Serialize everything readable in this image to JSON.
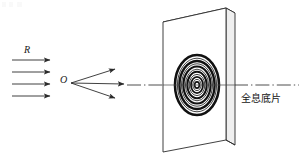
{
  "figure": {
    "canvas": {
      "width": 299,
      "height": 161,
      "background": "#ffffff"
    },
    "line_color": "#2b2b2b",
    "fill_color": "#ffffff",
    "labels": {
      "reference_beam": "R",
      "object_point": "O",
      "plate": "全息底片"
    },
    "reference_beam": {
      "name": "R",
      "count": 4,
      "x_start": 12,
      "x_end": 52,
      "y_values": [
        60,
        72,
        84,
        96
      ],
      "arrowhead": "solid-triangle"
    },
    "object_rays": {
      "origin_x": 70,
      "origin_y": 83,
      "endpoints": [
        {
          "x": 118,
          "y": 69
        },
        {
          "x": 126,
          "y": 83
        },
        {
          "x": 118,
          "y": 97
        }
      ],
      "arrowhead": "solid-triangle"
    },
    "optical_axis": {
      "x_start": 126,
      "x_end": 299,
      "y": 85,
      "style": "dash-dot"
    },
    "plate": {
      "shape": "3d-slab-parallelogram",
      "front_face": [
        [
          163,
          22
        ],
        [
          226,
          8
        ],
        [
          226,
          140
        ],
        [
          163,
          152
        ]
      ],
      "thickness_px": 9,
      "rings": {
        "center_x": 197,
        "center_y": 85,
        "count": 11,
        "rx_max": 22,
        "ry_max": 30,
        "pattern": "fresnel-zone-concentric-ellipses"
      }
    }
  }
}
